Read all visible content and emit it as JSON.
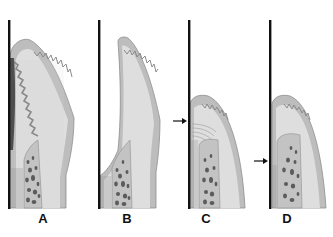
{
  "figure": {
    "panels": [
      {
        "id": "A",
        "label": "A",
        "arrow": false
      },
      {
        "id": "B",
        "label": "B",
        "arrow": false
      },
      {
        "id": "C",
        "label": "C",
        "arrow": true,
        "arrow_marks": "gingival margin level"
      },
      {
        "id": "D",
        "label": "D",
        "arrow": true,
        "arrow_marks": "bone crest level"
      }
    ],
    "colors": {
      "tooth_line": "#111111",
      "gingiva_outer": "#b9b9b9",
      "gingiva_inner": "#dcdcdc",
      "epithelium_edge": "#8a8a8a",
      "bone_fill": "#c4c4c4",
      "trabeculae": "#5a5a5a",
      "background": "#ffffff"
    }
  }
}
